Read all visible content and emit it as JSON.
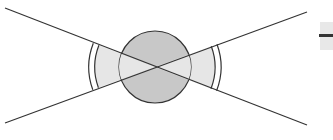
{
  "diagram": {
    "type": "double-cone-with-sphere",
    "colors": {
      "background": "#ffffff",
      "stroke": "#333333",
      "sphere_fill": "#c8c8c8",
      "cone_fill": "#e6e6e6",
      "fragment_fill": "#e8e8e8"
    },
    "intersection_point": {
      "x": 155,
      "y": 67
    },
    "lines": [
      {
        "name": "descending-line",
        "x1": 5,
        "y1": 8,
        "x2": 307,
        "y2": 125
      },
      {
        "name": "ascending-line",
        "x1": 5,
        "y1": 123,
        "x2": 307,
        "y2": 12
      }
    ],
    "sphere": {
      "cx": 155,
      "cy": 67,
      "r": 36
    },
    "cones": [
      {
        "side": "left",
        "inner_arc_radius": 60,
        "outer_arc_radius": 66
      },
      {
        "side": "right",
        "inner_arc_radius": 60,
        "outer_arc_radius": 66
      }
    ],
    "edge_fragment": {
      "visible": true,
      "description": "partially cut-off element at right edge"
    }
  }
}
